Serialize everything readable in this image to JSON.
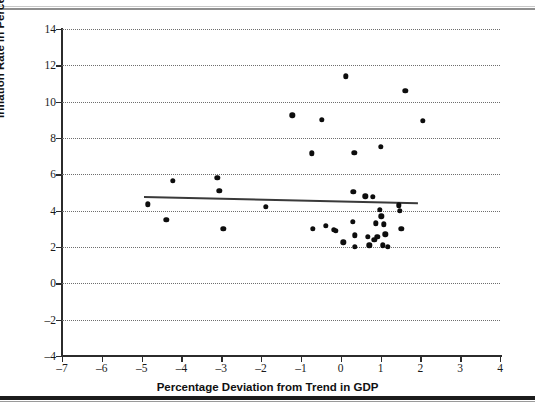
{
  "figure": {
    "background": "#ffffff",
    "point_color": "#0d0d0d",
    "trend_color": "#3a3a3a",
    "grid_color": "#6e6e6e"
  },
  "chart_data": {
    "type": "scatter",
    "title": "",
    "xlabel": "Percentage Deviation from Trend in GDP",
    "ylabel": "Inflation Rate in Percent",
    "xlim": [
      -7,
      4
    ],
    "ylim": [
      -4,
      14
    ],
    "xticks": [
      -7,
      -6,
      -5,
      -4,
      -3,
      -2,
      -1,
      0,
      1,
      2,
      3,
      4
    ],
    "yticks": [
      -4,
      -2,
      0,
      2,
      4,
      6,
      8,
      10,
      12,
      14
    ],
    "xticklabels": [
      "–7",
      "–6",
      "–5",
      "–4",
      "–3",
      "–2",
      "–1",
      "0",
      "1",
      "2",
      "3",
      "4"
    ],
    "yticklabels": [
      "–4",
      "–2",
      "0",
      "2",
      "4",
      "6",
      "8",
      "10",
      "12",
      "14"
    ],
    "grid": true,
    "grid_axis": "y",
    "grid_style": "dotted",
    "legend": null,
    "points": [
      {
        "x": -4.84,
        "y": 4.35
      },
      {
        "x": -4.38,
        "y": 3.5
      },
      {
        "x": -4.22,
        "y": 5.65
      },
      {
        "x": -3.1,
        "y": 5.8
      },
      {
        "x": -3.05,
        "y": 5.1
      },
      {
        "x": -2.95,
        "y": 3.0
      },
      {
        "x": -1.88,
        "y": 4.2
      },
      {
        "x": -1.22,
        "y": 9.25
      },
      {
        "x": -0.72,
        "y": 7.15
      },
      {
        "x": -0.7,
        "y": 3.0
      },
      {
        "x": -0.48,
        "y": 9.0
      },
      {
        "x": -0.38,
        "y": 3.15
      },
      {
        "x": -0.18,
        "y": 2.95
      },
      {
        "x": -0.13,
        "y": 2.9
      },
      {
        "x": 0.06,
        "y": 2.25
      },
      {
        "x": 0.13,
        "y": 11.4
      },
      {
        "x": 0.3,
        "y": 3.4
      },
      {
        "x": 0.32,
        "y": 5.05
      },
      {
        "x": 0.34,
        "y": 7.2
      },
      {
        "x": 0.35,
        "y": 2.65
      },
      {
        "x": 0.36,
        "y": 2.0
      },
      {
        "x": 0.62,
        "y": 4.8
      },
      {
        "x": 0.68,
        "y": 2.55
      },
      {
        "x": 0.72,
        "y": 2.1
      },
      {
        "x": 0.8,
        "y": 4.75
      },
      {
        "x": 0.84,
        "y": 2.4
      },
      {
        "x": 0.88,
        "y": 3.3
      },
      {
        "x": 0.92,
        "y": 2.55
      },
      {
        "x": 0.98,
        "y": 4.05
      },
      {
        "x": 1.0,
        "y": 7.5
      },
      {
        "x": 1.02,
        "y": 3.7
      },
      {
        "x": 1.05,
        "y": 2.1
      },
      {
        "x": 1.08,
        "y": 3.25
      },
      {
        "x": 1.12,
        "y": 2.7
      },
      {
        "x": 1.18,
        "y": 2.0
      },
      {
        "x": 1.46,
        "y": 4.3
      },
      {
        "x": 1.48,
        "y": 4.0
      },
      {
        "x": 1.52,
        "y": 3.0
      },
      {
        "x": 1.62,
        "y": 10.6
      },
      {
        "x": 2.06,
        "y": 8.95
      }
    ],
    "trendline": {
      "x_start": -4.93,
      "y_start": 4.73,
      "x_end": 1.95,
      "y_end": 4.38
    }
  }
}
